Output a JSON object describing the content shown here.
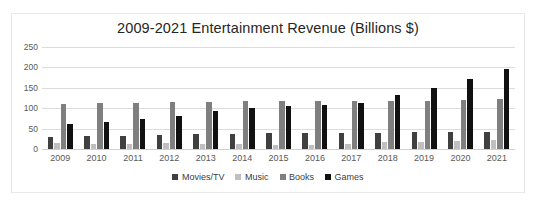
{
  "chart_data": {
    "type": "bar",
    "title": "2009-2021 Entertainment Revenue (Billions $)",
    "xlabel": "",
    "ylabel": "",
    "ylim": [
      0,
      250
    ],
    "yticks": [
      0,
      50,
      100,
      150,
      200,
      250
    ],
    "grid": true,
    "legend_position": "bottom",
    "categories": [
      "2009",
      "2010",
      "2011",
      "2012",
      "2013",
      "2014",
      "2015",
      "2016",
      "2017",
      "2018",
      "2019",
      "2020",
      "2021"
    ],
    "series": [
      {
        "name": "Movies/TV",
        "color": "#404040",
        "values": [
          30,
          32,
          33,
          35,
          36,
          38,
          40,
          39,
          40,
          40,
          41,
          41,
          42
        ]
      },
      {
        "name": "Music",
        "color": "#BFBFBF",
        "values": [
          14,
          13,
          12,
          14,
          13,
          12,
          11,
          11,
          13,
          16,
          18,
          20,
          21
        ]
      },
      {
        "name": "Books",
        "color": "#7F7F7F",
        "values": [
          111,
          112,
          113,
          115,
          116,
          117,
          117,
          118,
          118,
          118,
          118,
          121,
          123
        ]
      },
      {
        "name": "Games",
        "color": "#111111",
        "values": [
          61,
          66,
          73,
          81,
          92,
          100,
          105,
          107,
          114,
          132,
          149,
          172,
          195
        ]
      }
    ]
  }
}
